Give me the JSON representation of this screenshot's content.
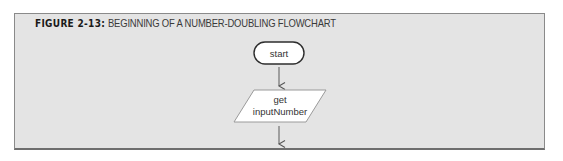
{
  "figure": {
    "label": "FIGURE 2-13:",
    "caption": "BEGINNING OF A NUMBER-DOUBLING FLOWCHART"
  },
  "flowchart": {
    "nodes": [
      {
        "id": "start",
        "shape": "terminal",
        "text": "start"
      },
      {
        "id": "input",
        "shape": "parallelogram",
        "lines": [
          "get",
          "inputNumber"
        ]
      }
    ],
    "edges": [
      {
        "from": "start",
        "to": "input"
      },
      {
        "from": "input",
        "to": "continuation"
      }
    ]
  },
  "colors": {
    "frame_bg": "#e4e4e4",
    "frame_border": "#8a8a8a",
    "node_fill": "#ffffff",
    "node_stroke": "#333333",
    "arrow": "#666666"
  }
}
